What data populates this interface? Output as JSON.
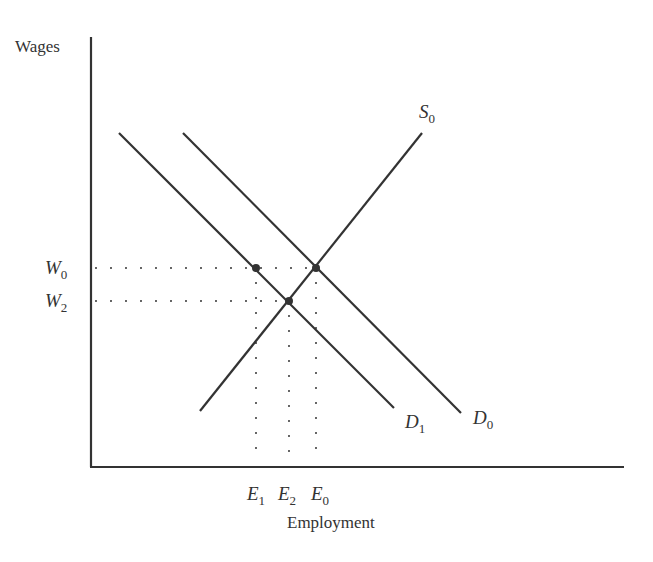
{
  "diagram": {
    "y_axis_label": "Wages",
    "x_axis_label": "Employment",
    "curves": {
      "S0": {
        "name": "S",
        "sub": "0",
        "type": "supply"
      },
      "D0": {
        "name": "D",
        "sub": "0",
        "type": "demand"
      },
      "D1": {
        "name": "D",
        "sub": "1",
        "type": "demand"
      }
    },
    "wage_levels": [
      {
        "name": "W",
        "sub": "0"
      },
      {
        "name": "W",
        "sub": "2"
      }
    ],
    "employment_levels": [
      {
        "name": "E",
        "sub": "1"
      },
      {
        "name": "E",
        "sub": "2"
      },
      {
        "name": "E",
        "sub": "0"
      }
    ],
    "equilibria": [
      {
        "label": "S0 ∩ D0",
        "wage": "W0",
        "employment": "E0"
      },
      {
        "label": "S0 ∩ D1",
        "wage": "W2",
        "employment": "E2"
      },
      {
        "label": "D1 at W0",
        "wage": "W0",
        "employment": "E1"
      }
    ],
    "colors": {
      "line": "#333333",
      "background": "#ffffff"
    }
  }
}
